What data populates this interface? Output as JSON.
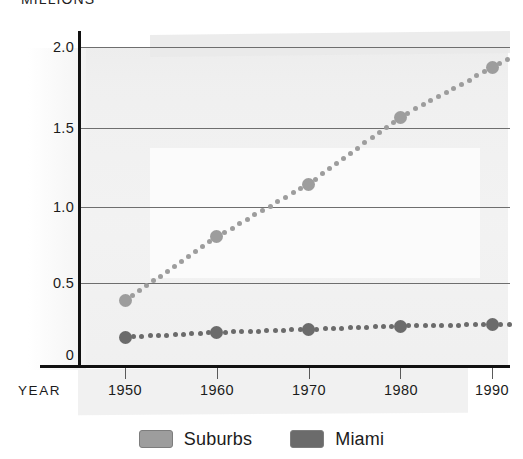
{
  "chart_data": {
    "type": "line",
    "title": "MILLIONS",
    "xlabel": "YEAR",
    "ylabel": "MILLIONS",
    "categories": [
      "1950",
      "1960",
      "1970",
      "1980",
      "1990"
    ],
    "x": [
      1950,
      1960,
      1970,
      1980,
      1990
    ],
    "series": [
      {
        "name": "Suburbs",
        "color": "#9d9d9d",
        "values": [
          0.41,
          0.81,
          1.14,
          1.56,
          1.87
        ]
      },
      {
        "name": "Miami",
        "color": "#6b6b6b",
        "values": [
          0.18,
          0.21,
          0.23,
          0.25,
          0.26
        ]
      }
    ],
    "ylim": [
      0,
      2.0
    ],
    "yticks": [
      "0",
      "0.5",
      "1.0",
      "1.5",
      "2.0"
    ],
    "ytick_values": [
      0,
      0.5,
      1.0,
      1.5,
      2.0
    ],
    "grid": true,
    "legend_position": "bottom",
    "style": "dotted"
  },
  "axes": {
    "y_title": "MILLIONS",
    "x_title": "YEAR",
    "y_ticks": [
      {
        "label": "2.0",
        "value": 2.0
      },
      {
        "label": "1.5",
        "value": 1.5
      },
      {
        "label": "1.0",
        "value": 1.0
      },
      {
        "label": "0.5",
        "value": 0.5
      },
      {
        "label": "0",
        "value": 0.0
      }
    ],
    "x_ticks": [
      {
        "label": "1950"
      },
      {
        "label": "1960"
      },
      {
        "label": "1970"
      },
      {
        "label": "1980"
      },
      {
        "label": "1990"
      }
    ]
  },
  "legend": {
    "items": [
      {
        "label": "Suburbs",
        "color": "#9d9d9d"
      },
      {
        "label": "Miami",
        "color": "#6b6b6b"
      }
    ]
  },
  "colors": {
    "suburbs": "#9d9d9d",
    "miami": "#6b6b6b",
    "axis": "#111111",
    "grid": "#6e6e6e",
    "paper": "#eeeeee"
  }
}
